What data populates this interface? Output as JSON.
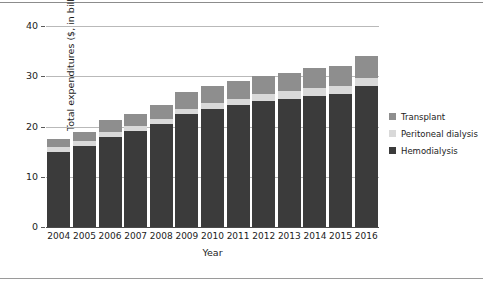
{
  "chart_data": {
    "type": "bar",
    "stacked": true,
    "title": "",
    "xlabel": "Year",
    "ylabel": "Total expenditures ($, in billions)",
    "categories": [
      "2004",
      "2005",
      "2006",
      "2007",
      "2008",
      "2009",
      "2010",
      "2011",
      "2012",
      "2013",
      "2014",
      "2015",
      "2016"
    ],
    "series": [
      {
        "name": "Hemodialysis",
        "color": "#3b3b3b",
        "values": [
          15.0,
          16.2,
          18.0,
          19.1,
          20.5,
          22.4,
          23.5,
          24.2,
          25.1,
          25.5,
          26.0,
          26.5,
          28.0
        ]
      },
      {
        "name": "Peritoneal dialysis",
        "color": "#d9d9d9",
        "values": [
          0.9,
          0.9,
          0.9,
          1.0,
          1.0,
          1.1,
          1.2,
          1.3,
          1.4,
          1.5,
          1.6,
          1.6,
          1.6
        ]
      },
      {
        "name": "Transplant",
        "color": "#8e8e8e",
        "values": [
          1.6,
          1.9,
          2.4,
          2.4,
          2.7,
          3.4,
          3.4,
          3.6,
          3.6,
          3.6,
          4.0,
          4.0,
          4.5
        ]
      }
    ],
    "totals": [
      17.5,
      19.0,
      21.3,
      22.5,
      24.2,
      26.9,
      28.1,
      29.1,
      30.1,
      30.6,
      31.6,
      32.1,
      34.1
    ],
    "ylim": [
      0,
      40
    ],
    "yticks": [
      0,
      10,
      20,
      30,
      40
    ],
    "ytick_labels": [
      "0",
      "10",
      "20",
      "30",
      "40"
    ],
    "grid": "horizontal",
    "legend_position": "right",
    "legend": [
      {
        "label": "Transplant",
        "color": "#8e8e8e"
      },
      {
        "label": "Peritoneal dialysis",
        "color": "#d9d9d9"
      },
      {
        "label": "Hemodialysis",
        "color": "#3b3b3b"
      }
    ]
  }
}
